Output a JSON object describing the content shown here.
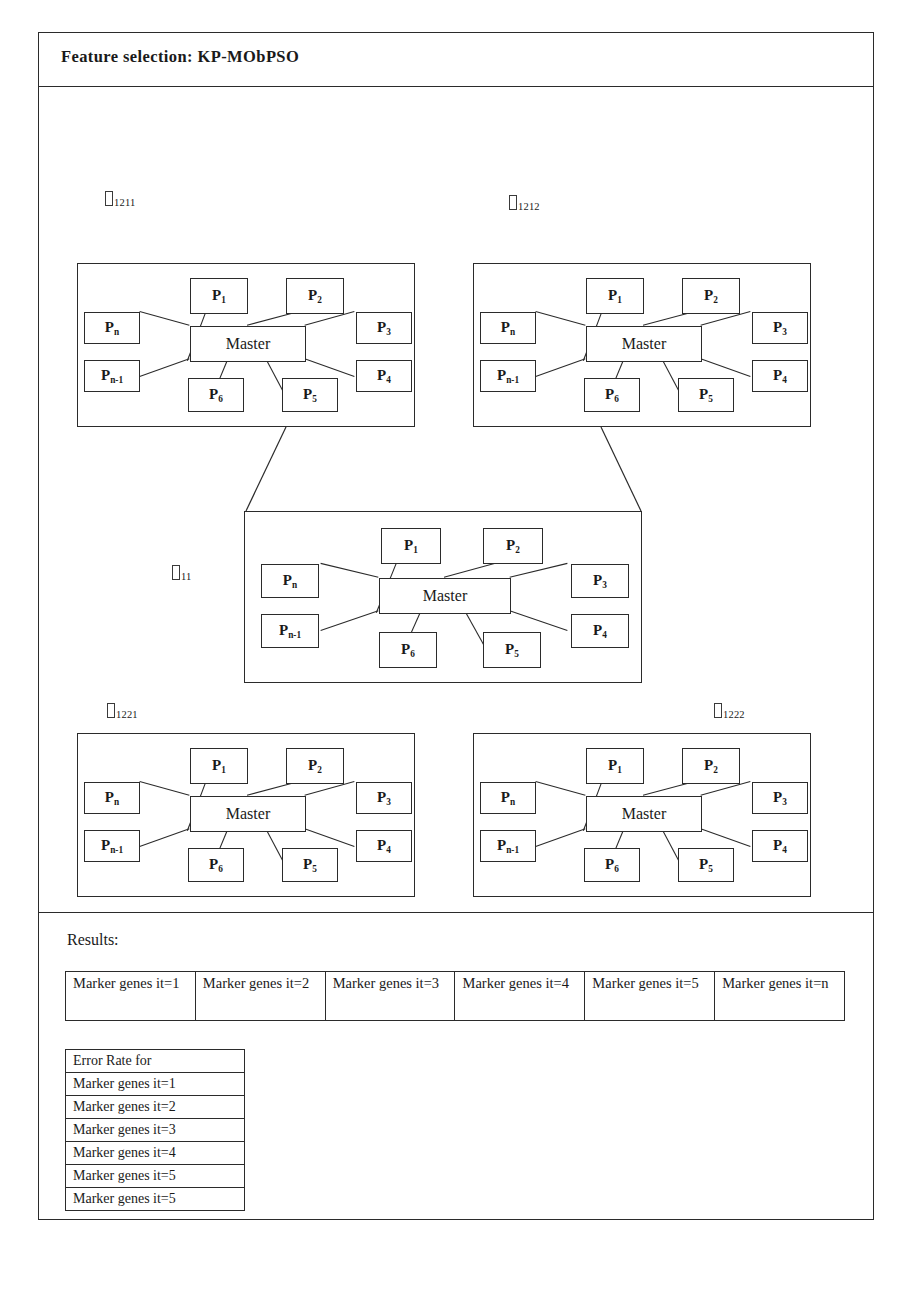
{
  "figure": {
    "title": "Feature selection: KP-MObPSO",
    "results_heading": "Results:"
  },
  "node_labels": {
    "master": "Master",
    "p1": "P",
    "p1_sub": "1",
    "p2": "P",
    "p2_sub": "2",
    "p3": "P",
    "p3_sub": "3",
    "p4": "P",
    "p4_sub": "4",
    "p5": "P",
    "p5_sub": "5",
    "p6": "P",
    "p6_sub": "6",
    "pn": "P",
    "pn_sub": "n",
    "pn1": "P",
    "pn1_sub": "n-1"
  },
  "clusters": [
    {
      "id": "top-left",
      "label_sub": "1211"
    },
    {
      "id": "top-right",
      "label_sub": "1212"
    },
    {
      "id": "center",
      "label_sub": "11"
    },
    {
      "id": "bottom-left",
      "label_sub": "1221"
    },
    {
      "id": "bottom-right",
      "label_sub": "1222"
    }
  ],
  "marker_table": {
    "cells": [
      "Marker genes it=1",
      "Marker genes it=2",
      "Marker genes it=3",
      "Marker genes it=4",
      "Marker genes it=5",
      "Marker genes it=n"
    ]
  },
  "error_table": {
    "header": "Error Rate for",
    "rows": [
      "Marker genes it=1",
      "Marker genes it=2",
      "Marker genes it=3",
      "Marker genes it=4",
      "Marker genes it=5",
      "Marker genes it=5"
    ]
  },
  "colors": {
    "line": "#2b2b2b",
    "background": "#ffffff",
    "text": "#1a1a1a"
  }
}
